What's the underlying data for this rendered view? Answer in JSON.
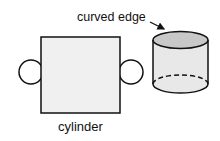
{
  "labels": {
    "curved_edge": "curved edge",
    "cylinder": "cylinder"
  },
  "colors": {
    "stroke": "#111111",
    "face_fill": "#f0f0f0",
    "top_fill": "#c8c8c8",
    "side_fill": "#e8e8e8"
  }
}
